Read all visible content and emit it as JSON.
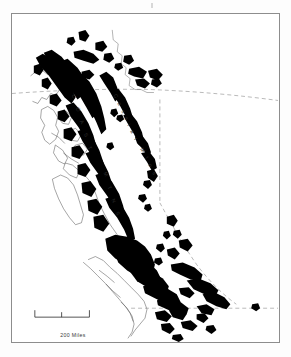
{
  "figure": {
    "kind": "map",
    "region": "British Columbia",
    "caption_text": "200 Miles",
    "background_color": "#ffffff",
    "frame_color": "#8d8d8d",
    "shading_color": "#000000",
    "coastline_color": "#555555",
    "boundary_color": "#777777"
  },
  "labels": [
    {
      "id": "coast-mtns",
      "text": "C O A S T   M T N S",
      "style": "spaced-diagonal"
    },
    {
      "id": "cassiar-mtns",
      "text": "Cassiar Mtns",
      "style": "spaced-diagonal"
    }
  ],
  "coast_label": {
    "letters": [
      "C",
      "O",
      "A",
      "S",
      "T",
      "M",
      "T",
      "N",
      "S"
    ]
  },
  "cassiar_label": {
    "letters": [
      "C",
      "a",
      "s",
      "s",
      "i",
      "a",
      "r",
      " ",
      "M",
      "t",
      "n",
      "s"
    ],
    "text": "Cassiar Mtns"
  },
  "scale_bar": {
    "caption": "200 Miles",
    "total_value": 200,
    "units": "Miles",
    "ticks": [
      "0",
      "100",
      "200"
    ]
  },
  "legend": {
    "shaded_meaning": "Mountainous terrain"
  }
}
